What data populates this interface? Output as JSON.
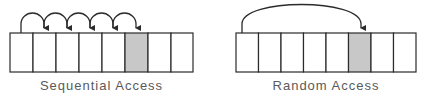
{
  "diagrams": [
    {
      "id": "sequential",
      "caption": "Sequential Access",
      "cell_count": 8,
      "highlighted_cell_index": 5,
      "arrow_type": "hops",
      "hops": [
        [
          0,
          1
        ],
        [
          1,
          2
        ],
        [
          2,
          3
        ],
        [
          3,
          4
        ],
        [
          4,
          5
        ]
      ]
    },
    {
      "id": "random",
      "caption": "Random Access",
      "cell_count": 8,
      "highlighted_cell_index": 5,
      "arrow_type": "direct",
      "hops": [
        [
          0,
          5
        ]
      ]
    }
  ],
  "colors": {
    "stroke": "#2b2b2b",
    "highlight_fill": "#c8c8c8",
    "cell_fill": "#ffffff",
    "caption": "#5a5a5a"
  }
}
